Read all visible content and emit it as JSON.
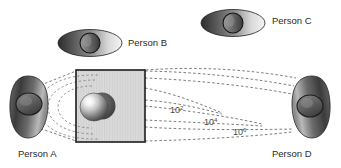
{
  "figure": {
    "title_visible": false,
    "background_color": "#ffffff",
    "ink_color": "#2b2b2b",
    "dash_color": "#6e6e6e",
    "people": [
      {
        "id": "person-a",
        "label": "Person A",
        "orientation": "side-view-vertical",
        "position": "left",
        "label_x": 18,
        "label_y": 157
      },
      {
        "id": "person-b",
        "label": "Person B",
        "orientation": "top-view-horizontal",
        "position": "upper-left-middle",
        "label_x": 128,
        "label_y": 46
      },
      {
        "id": "person-c",
        "label": "Person C",
        "orientation": "top-view-horizontal",
        "position": "upper-right",
        "label_x": 272,
        "label_y": 24
      },
      {
        "id": "person-d",
        "label": "Person D",
        "orientation": "side-view-vertical",
        "position": "right",
        "label_x": 272,
        "label_y": 157
      }
    ],
    "scale_labels": [
      {
        "id": "scale-10e2",
        "base": "10",
        "exponent": "2",
        "x": 170,
        "y": 113
      },
      {
        "id": "scale-10e4",
        "base": "10",
        "exponent": "4",
        "x": 204,
        "y": 125
      },
      {
        "id": "scale-10e6",
        "base": "10",
        "exponent": "6",
        "x": 233,
        "y": 135
      }
    ],
    "center_box": {
      "id": "hatched-box",
      "x": 76,
      "y": 70,
      "width": 69,
      "height": 72,
      "fill_pattern": "vertical-hatch",
      "border_color": "#1c1c1c"
    },
    "sphere": {
      "id": "central-sphere",
      "cx": 94,
      "cy": 107,
      "r": 14,
      "highlight": "upper-left"
    }
  }
}
